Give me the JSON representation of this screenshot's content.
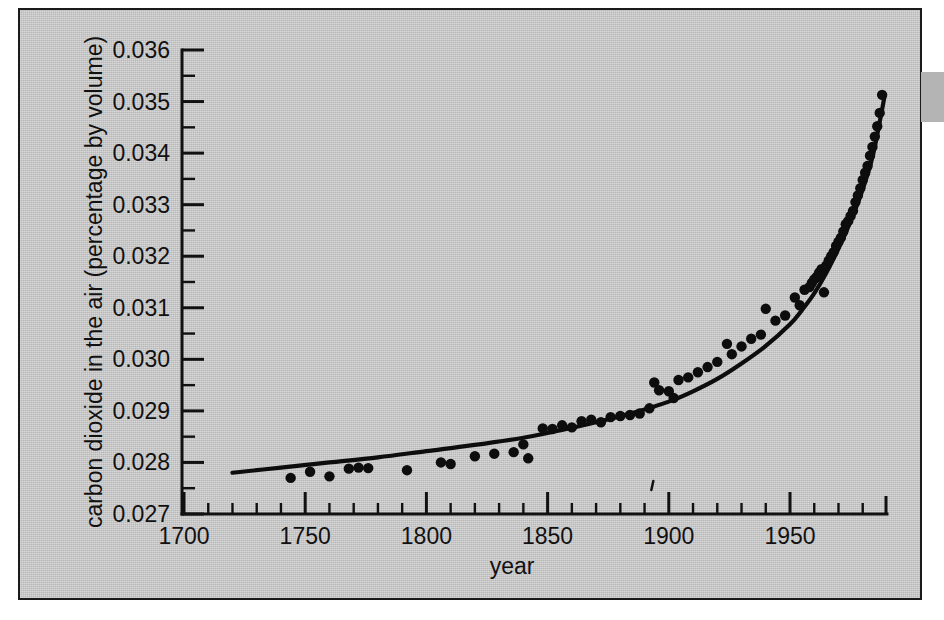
{
  "figure": {
    "background_color": "#c8c8c8",
    "border_color": "#1a1a1a",
    "ink_color": "#0d0d0d",
    "edge_tab_color": "#b4b4b4"
  },
  "chart_data": {
    "type": "scatter",
    "title": "",
    "xlabel": "year",
    "ylabel": "carbon dioxide in the air (percentage by volume)",
    "xlim": [
      1700,
      2000
    ],
    "ylim": [
      0.027,
      0.036
    ],
    "grid": false,
    "legend": null,
    "x_ticks_major": [
      1700,
      1750,
      1800,
      1850,
      1900,
      1950
    ],
    "x_tick_labels": [
      "1700",
      "1750",
      "1800",
      "1850",
      "1900",
      "1950"
    ],
    "x_tick_minor_step": 10,
    "y_ticks_major": [
      0.027,
      0.028,
      0.029,
      0.03,
      0.031,
      0.032,
      0.033,
      0.034,
      0.035,
      0.036
    ],
    "y_tick_labels": [
      "0.027",
      "0.028",
      "0.029",
      "0.030",
      "0.031",
      "0.032",
      "0.033",
      "0.034",
      "0.035",
      "0.036"
    ],
    "y_tick_minor_step": 0.0005,
    "series": [
      {
        "name": "measured carbon dioxide",
        "marker": "filled-circle",
        "points": [
          [
            1744,
            0.0277
          ],
          [
            1752,
            0.02782
          ],
          [
            1760,
            0.02773
          ],
          [
            1768,
            0.02788
          ],
          [
            1772,
            0.0279
          ],
          [
            1776,
            0.02789
          ],
          [
            1792,
            0.02785
          ],
          [
            1806,
            0.028
          ],
          [
            1810,
            0.02797
          ],
          [
            1820,
            0.02812
          ],
          [
            1828,
            0.02817
          ],
          [
            1836,
            0.0282
          ],
          [
            1840,
            0.02835
          ],
          [
            1842,
            0.02808
          ],
          [
            1848,
            0.02866
          ],
          [
            1852,
            0.02865
          ],
          [
            1856,
            0.02872
          ],
          [
            1860,
            0.02868
          ],
          [
            1864,
            0.0288
          ],
          [
            1868,
            0.02883
          ],
          [
            1872,
            0.02878
          ],
          [
            1876,
            0.02888
          ],
          [
            1880,
            0.0289
          ],
          [
            1884,
            0.02892
          ],
          [
            1888,
            0.02895
          ],
          [
            1892,
            0.02905
          ],
          [
            1894,
            0.02955
          ],
          [
            1896,
            0.0294
          ],
          [
            1900,
            0.02938
          ],
          [
            1902,
            0.02925
          ],
          [
            1904,
            0.0296
          ],
          [
            1908,
            0.02965
          ],
          [
            1912,
            0.02975
          ],
          [
            1916,
            0.02985
          ],
          [
            1920,
            0.02995
          ],
          [
            1924,
            0.0303
          ],
          [
            1926,
            0.0301
          ],
          [
            1930,
            0.03025
          ],
          [
            1934,
            0.0304
          ],
          [
            1938,
            0.03048
          ],
          [
            1940,
            0.03098
          ],
          [
            1944,
            0.03075
          ],
          [
            1948,
            0.03085
          ],
          [
            1952,
            0.0312
          ],
          [
            1954,
            0.03105
          ],
          [
            1956,
            0.03135
          ],
          [
            1958,
            0.0314
          ],
          [
            1959,
            0.03148
          ],
          [
            1960,
            0.03155
          ],
          [
            1961,
            0.0316
          ],
          [
            1962,
            0.03168
          ],
          [
            1963,
            0.03175
          ],
          [
            1964,
            0.0313
          ],
          [
            1965,
            0.03182
          ],
          [
            1966,
            0.03192
          ],
          [
            1967,
            0.032
          ],
          [
            1968,
            0.03208
          ],
          [
            1969,
            0.0322
          ],
          [
            1970,
            0.03228
          ],
          [
            1971,
            0.03236
          ],
          [
            1972,
            0.03248
          ],
          [
            1973,
            0.03262
          ],
          [
            1974,
            0.03268
          ],
          [
            1975,
            0.03278
          ],
          [
            1976,
            0.03288
          ],
          [
            1977,
            0.03305
          ],
          [
            1978,
            0.03318
          ],
          [
            1979,
            0.03332
          ],
          [
            1980,
            0.03348
          ],
          [
            1981,
            0.03362
          ],
          [
            1982,
            0.03375
          ],
          [
            1983,
            0.03395
          ],
          [
            1984,
            0.03412
          ],
          [
            1985,
            0.03432
          ],
          [
            1986,
            0.03452
          ],
          [
            1987,
            0.03478
          ],
          [
            1988,
            0.03513
          ]
        ]
      }
    ],
    "fit_curve": {
      "name": "fitted trend",
      "points": [
        [
          1720,
          0.0278
        ],
        [
          1740,
          0.0279
        ],
        [
          1760,
          0.028
        ],
        [
          1780,
          0.0281
        ],
        [
          1800,
          0.02822
        ],
        [
          1820,
          0.02834
        ],
        [
          1840,
          0.02848
        ],
        [
          1855,
          0.02862
        ],
        [
          1870,
          0.02878
        ],
        [
          1885,
          0.02896
        ],
        [
          1900,
          0.02918
        ],
        [
          1910,
          0.02938
        ],
        [
          1920,
          0.02962
        ],
        [
          1930,
          0.02992
        ],
        [
          1940,
          0.03026
        ],
        [
          1950,
          0.03068
        ],
        [
          1955,
          0.03096
        ],
        [
          1960,
          0.03128
        ],
        [
          1965,
          0.03168
        ],
        [
          1970,
          0.03215
        ],
        [
          1975,
          0.03268
        ],
        [
          1980,
          0.0333
        ],
        [
          1984,
          0.03392
        ],
        [
          1987,
          0.0346
        ],
        [
          1989,
          0.0351
        ]
      ]
    },
    "annotations": [
      {
        "kind": "stray-mark",
        "x": 1893,
        "y_axis_offset": 0.0003
      }
    ]
  }
}
